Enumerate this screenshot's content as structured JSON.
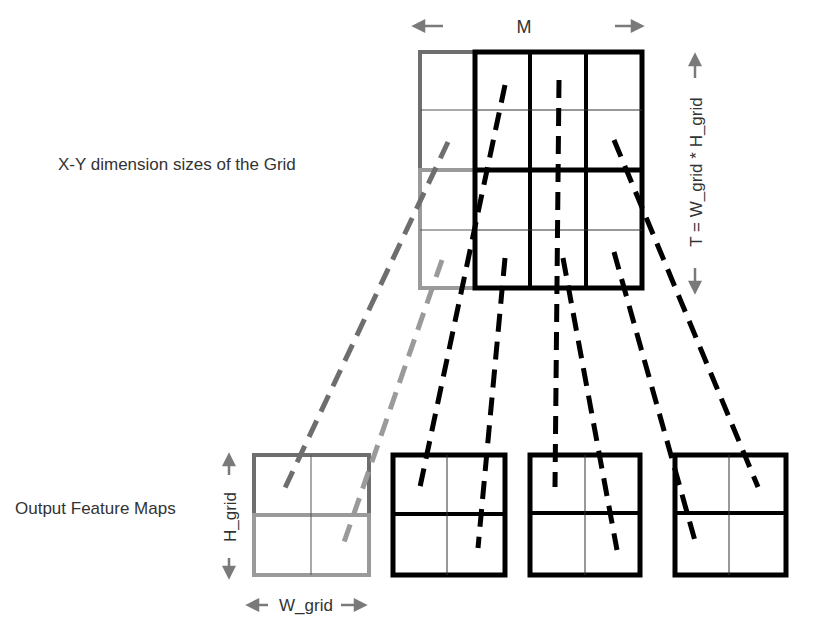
{
  "labels": {
    "grid_label": "X-Y dimension sizes of the Grid",
    "output_label": "Output Feature Maps",
    "m_label": "M",
    "t_label": "T = W_grid * H_grid",
    "h_grid_label": "H_grid",
    "w_grid_label": "W_grid"
  },
  "colors": {
    "dark": "#000000",
    "gray_dark": "#6e6e6e",
    "gray_light": "#9a9a9a",
    "arrow": "#7a7a7a",
    "text": "#333333"
  },
  "grid": {
    "columns": 4,
    "rows": 4,
    "x": 418,
    "y": 50,
    "width": 225,
    "height": 240
  },
  "output_maps": [
    {
      "id": 1,
      "style": "gray",
      "x": 252,
      "y": 453,
      "w": 118,
      "h": 124
    },
    {
      "id": 2,
      "style": "black",
      "x": 390,
      "y": 453,
      "w": 116,
      "h": 123
    },
    {
      "id": 3,
      "style": "black",
      "x": 528,
      "y": 453,
      "w": 112,
      "h": 123
    },
    {
      "id": 4,
      "style": "black",
      "x": 673,
      "y": 453,
      "w": 114,
      "h": 123
    }
  ]
}
